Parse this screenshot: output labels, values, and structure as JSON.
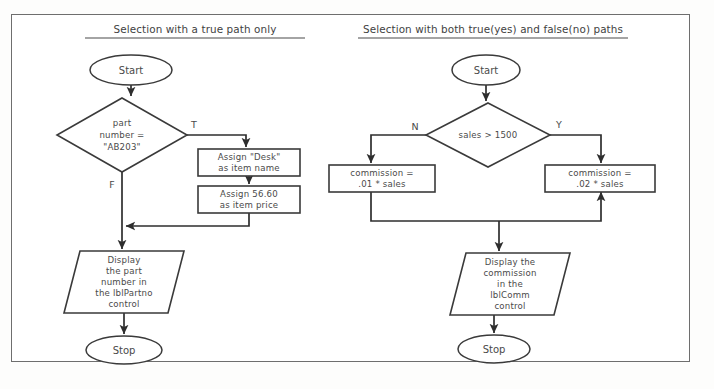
{
  "page": {
    "background_color": "#fdfdfc",
    "frame_color": "#6e6e6e",
    "ink_color": "#3a3a3a",
    "text_color": "#4a4a4a"
  },
  "charts": [
    {
      "id": "true-path-only",
      "title": "Selection with a true path only",
      "title_x": 195,
      "title_y": 33,
      "title_underline": {
        "x1": 85,
        "x2": 305,
        "y": 38
      },
      "nodes": {
        "start": {
          "label": "Start",
          "cx": 131,
          "cy": 70,
          "rx": 41,
          "ry": 15
        },
        "decision": {
          "lines": [
            "part",
            "number =",
            "\"AB203\""
          ],
          "cx": 122,
          "cy": 135,
          "rx": 65,
          "ry": 37
        },
        "true_label": {
          "text": "T",
          "x": 194,
          "y": 128
        },
        "false_label": {
          "text": "F",
          "x": 112,
          "y": 188
        },
        "process1": {
          "lines": [
            "Assign \"Desk\"",
            "as item name"
          ],
          "x": 198,
          "y": 149,
          "w": 102,
          "h": 27
        },
        "process2": {
          "lines": [
            "Assign 56.60",
            "as item price"
          ],
          "x": 198,
          "y": 186,
          "w": 102,
          "h": 27
        },
        "output": {
          "lines": [
            "Display",
            "the part",
            "number in",
            "the lblPartno",
            "control"
          ],
          "x": 64,
          "y": 251,
          "w": 120,
          "h": 62,
          "skew": 16
        },
        "stop": {
          "label": "Stop",
          "cx": 124,
          "cy": 350,
          "rx": 38,
          "ry": 14
        }
      }
    },
    {
      "id": "true-and-false-paths",
      "title": "Selection with both true(yes) and false(no) paths",
      "title_x": 493,
      "title_y": 33,
      "title_underline": {
        "x1": 358,
        "x2": 628,
        "y": 38
      },
      "nodes": {
        "start": {
          "label": "Start",
          "cx": 486,
          "cy": 70,
          "rx": 34,
          "ry": 15
        },
        "decision": {
          "lines": [
            "sales > 1500"
          ],
          "cx": 488,
          "cy": 135,
          "rx": 62,
          "ry": 32
        },
        "false_label": {
          "text": "N",
          "x": 415,
          "y": 130
        },
        "true_label": {
          "text": "Y",
          "x": 559,
          "y": 128
        },
        "process_left": {
          "lines": [
            "commission =",
            ".01 * sales"
          ],
          "x": 329,
          "y": 165,
          "w": 106,
          "h": 27
        },
        "process_right": {
          "lines": [
            "commission =",
            ".02 * sales"
          ],
          "x": 545,
          "y": 165,
          "w": 110,
          "h": 27
        },
        "output": {
          "lines": [
            "Display the",
            "commission",
            "in the",
            "lblComm",
            "control"
          ],
          "x": 450,
          "y": 253,
          "w": 120,
          "h": 62,
          "skew": 16
        },
        "stop": {
          "label": "Stop",
          "cx": 494,
          "cy": 349,
          "rx": 36,
          "ry": 14
        }
      }
    }
  ],
  "connectors": {
    "left": [
      "M131,85 L131,96",
      "M187,135 L246,135 L246,147",
      "M249,176 L249,184",
      "M249,213 L249,226 L126,226",
      "M122,172 L122,249",
      "M124,313 L124,334"
    ],
    "right": [
      "M486,85 L486,101",
      "M426,135 L371,135 L371,163",
      "M550,135 L601,135 L601,163",
      "M371,192 L371,221 L601,221 L601,192",
      "M499,221 L499,251",
      "M494,315 L494,333"
    ]
  }
}
